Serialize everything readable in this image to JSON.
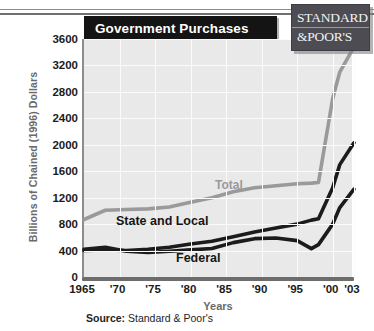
{
  "title": "Government Purchases",
  "logo": {
    "line1": "STANDARD",
    "line2": "&POOR'S"
  },
  "source": {
    "label": "Source:",
    "value": "Standard & Poor's"
  },
  "chart_data": {
    "type": "line",
    "title": "Government Purchases",
    "xlabel": "Years",
    "ylabel": "Billions of Chained (1996) Dollars",
    "ylim": [
      0,
      3600
    ],
    "ytick_values": [
      0,
      400,
      800,
      1200,
      1600,
      2000,
      2400,
      2800,
      3200,
      3600
    ],
    "ytick_labels": [
      "0",
      "400",
      "800",
      "1200",
      "1600",
      "2000",
      "2400",
      "2800",
      "3200",
      "3600"
    ],
    "xlim": [
      1965,
      2003
    ],
    "xtick_values": [
      1965,
      1970,
      1975,
      1980,
      1985,
      1990,
      1995,
      2000,
      2003
    ],
    "xtick_labels": [
      "1965",
      "'70",
      "'75",
      "'80",
      "'85",
      "'90",
      "'95",
      "'00",
      "'03"
    ],
    "grid": true,
    "legend": "inline-annotations",
    "x": [
      1965,
      1968,
      1971,
      1974,
      1977,
      1980,
      1983,
      1986,
      1989,
      1992,
      1995,
      1997,
      1998,
      2000,
      2001,
      2003
    ],
    "series": [
      {
        "name": "Total",
        "color": "#9a9a9a",
        "values": [
          870,
          1010,
          1020,
          1030,
          1060,
          1130,
          1200,
          1290,
          1350,
          1380,
          1410,
          1420,
          1430,
          2700,
          3100,
          3480
        ]
      },
      {
        "name": "State and Local",
        "color": "#1b1b1b",
        "values": [
          400,
          410,
          400,
          420,
          450,
          500,
          540,
          610,
          680,
          740,
          800,
          860,
          880,
          1350,
          1700,
          2030
        ]
      },
      {
        "name": "Federal",
        "color": "#1b1b1b",
        "values": [
          420,
          450,
          390,
          370,
          390,
          410,
          430,
          520,
          580,
          590,
          550,
          430,
          490,
          800,
          1050,
          1330
        ]
      }
    ]
  }
}
